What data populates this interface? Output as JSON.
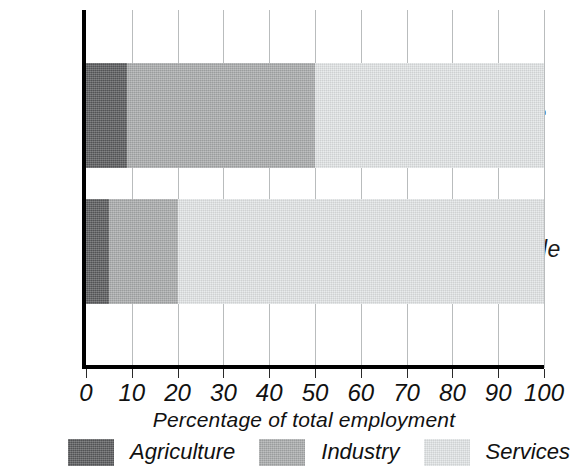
{
  "chart_data": {
    "type": "bar",
    "orientation": "horizontal",
    "stacked": true,
    "title": "",
    "xlabel": "Percentage of total employment",
    "ylabel": "",
    "categories": [
      "Male",
      "Female"
    ],
    "xlim": [
      0,
      100
    ],
    "xticks": [
      0,
      10,
      20,
      30,
      40,
      50,
      60,
      70,
      80,
      90,
      100
    ],
    "xticklabels": [
      "0",
      "10",
      "20",
      "30",
      "40",
      "50",
      "60",
      "70",
      "80",
      "90",
      "100"
    ],
    "grid": "vertical",
    "legend_position": "bottom",
    "series": [
      {
        "name": "Agriculture",
        "color": "#595a5c",
        "values": [
          9,
          5
        ]
      },
      {
        "name": "Industry",
        "color": "#a9abac",
        "values": [
          41,
          15
        ]
      },
      {
        "name": "Services",
        "color": "#e2e5e6",
        "values": [
          50,
          80
        ]
      }
    ],
    "segment_bounds": {
      "Male": [
        [
          0,
          9
        ],
        [
          9,
          50
        ],
        [
          50,
          100
        ]
      ],
      "Female": [
        [
          0,
          5
        ],
        [
          5,
          20
        ],
        [
          20,
          100
        ]
      ]
    }
  },
  "axis": {
    "x_title": "Percentage of total employment",
    "tick_labels": [
      "0",
      "10",
      "20",
      "30",
      "40",
      "50",
      "60",
      "70",
      "80",
      "90",
      "100"
    ],
    "category_labels": [
      "Male",
      "Female"
    ]
  },
  "legend": {
    "items": [
      {
        "label": "Agriculture",
        "color": "#595a5c"
      },
      {
        "label": "Industry",
        "color": "#a9abac"
      },
      {
        "label": "Services",
        "color": "#e2e5e6"
      }
    ]
  },
  "colors": {
    "agriculture": "#595a5c",
    "industry": "#a9abac",
    "services": "#e2e5e6",
    "axis": "#000000",
    "gridline": "#b9bcbd",
    "text": "#111111",
    "background": "#ffffff"
  }
}
